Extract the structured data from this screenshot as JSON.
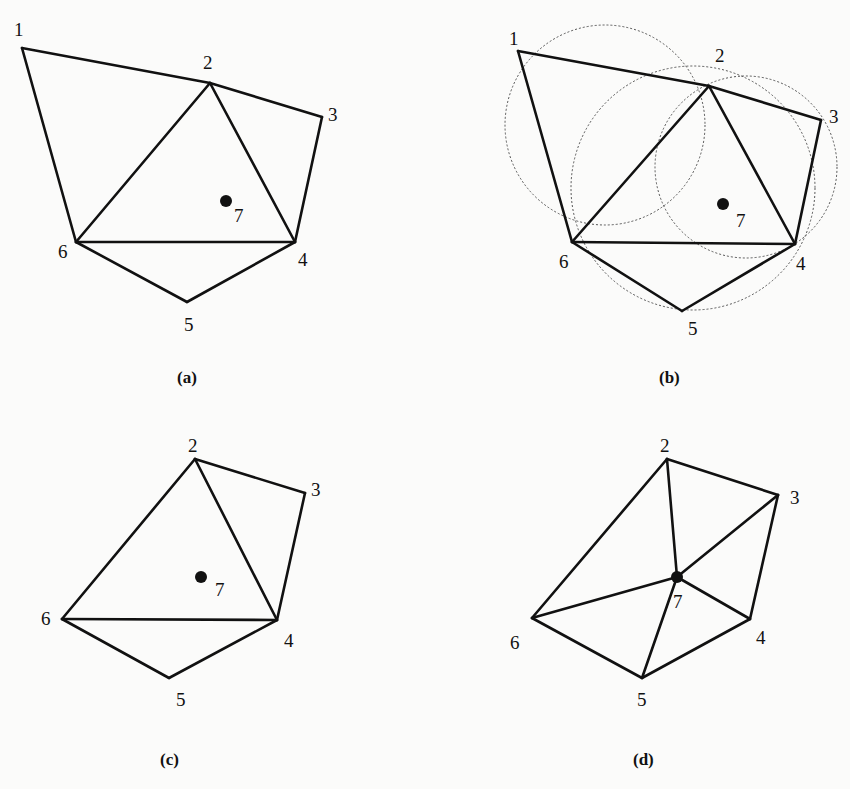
{
  "figure": {
    "panels": [
      {
        "id": "a",
        "caption": "(a)",
        "vertices": {
          "1": [
            22,
            48
          ],
          "2": [
            210,
            83
          ],
          "3": [
            322,
            117
          ],
          "4": [
            295,
            242
          ],
          "5": [
            187,
            302
          ],
          "6": [
            76,
            242
          ]
        },
        "labels": {
          "1": [
            14,
            36
          ],
          "2": [
            203,
            69
          ],
          "3": [
            328,
            121
          ],
          "4": [
            298,
            266
          ],
          "5": [
            184,
            331
          ],
          "6": [
            58,
            258
          ],
          "7": [
            234,
            222
          ]
        },
        "insert_point": {
          "id": "7",
          "pos": [
            226,
            201
          ]
        },
        "edges": [
          [
            "1",
            "2"
          ],
          [
            "2",
            "3"
          ],
          [
            "3",
            "4"
          ],
          [
            "4",
            "5"
          ],
          [
            "5",
            "6"
          ],
          [
            "6",
            "1"
          ],
          [
            "2",
            "6"
          ],
          [
            "2",
            "4"
          ],
          [
            "6",
            "4"
          ]
        ],
        "circles": [],
        "caption_pos": [
          177,
          383
        ]
      },
      {
        "id": "b",
        "caption": "(b)",
        "vertices": {
          "1": [
            518,
            51
          ],
          "2": [
            709,
            86
          ],
          "3": [
            821,
            120
          ],
          "4": [
            795,
            244
          ],
          "5": [
            682,
            311
          ],
          "6": [
            572,
            242
          ]
        },
        "labels": {
          "1": [
            509,
            45
          ],
          "2": [
            715,
            62
          ],
          "3": [
            829,
            123
          ],
          "4": [
            796,
            270
          ],
          "5": [
            688,
            335
          ],
          "6": [
            559,
            268
          ],
          "7": [
            736,
            227
          ]
        },
        "insert_point": {
          "id": "7",
          "pos": [
            723,
            204
          ]
        },
        "edges": [
          [
            "1",
            "2"
          ],
          [
            "2",
            "3"
          ],
          [
            "3",
            "4"
          ],
          [
            "4",
            "5"
          ],
          [
            "5",
            "6"
          ],
          [
            "6",
            "1"
          ],
          [
            "2",
            "6"
          ],
          [
            "2",
            "4"
          ],
          [
            "6",
            "4"
          ]
        ],
        "circles": [
          {
            "cx": 605,
            "cy": 125,
            "r": 100
          },
          {
            "cx": 693,
            "cy": 188,
            "r": 122
          },
          {
            "cx": 746,
            "cy": 167,
            "r": 91
          }
        ],
        "caption_pos": [
          659,
          383
        ]
      },
      {
        "id": "c",
        "caption": "(c)",
        "vertices": {
          "2": [
            195,
            459
          ],
          "3": [
            305,
            493
          ],
          "4": [
            277,
            620
          ],
          "5": [
            169,
            678
          ],
          "6": [
            62,
            619
          ]
        },
        "labels": {
          "2": [
            188,
            452
          ],
          "3": [
            311,
            496
          ],
          "4": [
            284,
            647
          ],
          "5": [
            176,
            706
          ],
          "6": [
            41,
            625
          ],
          "7": [
            215,
            596
          ]
        },
        "insert_point": {
          "id": "7",
          "pos": [
            201,
            577
          ]
        },
        "edges": [
          [
            "2",
            "3"
          ],
          [
            "3",
            "4"
          ],
          [
            "4",
            "5"
          ],
          [
            "5",
            "6"
          ],
          [
            "2",
            "6"
          ],
          [
            "2",
            "4"
          ],
          [
            "6",
            "4"
          ]
        ],
        "circles": [],
        "caption_pos": [
          160,
          765
        ]
      },
      {
        "id": "d",
        "caption": "(d)",
        "vertices": {
          "2": [
            667,
            459
          ],
          "3": [
            778,
            495
          ],
          "4": [
            750,
            619
          ],
          "5": [
            642,
            678
          ],
          "6": [
            532,
            618
          ],
          "7": [
            677,
            577
          ]
        },
        "labels": {
          "2": [
            660,
            452
          ],
          "3": [
            790,
            504
          ],
          "4": [
            756,
            644
          ],
          "5": [
            637,
            706
          ],
          "6": [
            510,
            649
          ],
          "7": [
            673,
            608
          ]
        },
        "insert_point": {
          "id": "7",
          "pos": [
            677,
            577
          ]
        },
        "edges": [
          [
            "2",
            "3"
          ],
          [
            "3",
            "4"
          ],
          [
            "4",
            "5"
          ],
          [
            "5",
            "6"
          ],
          [
            "6",
            "2"
          ],
          [
            "7",
            "2"
          ],
          [
            "7",
            "3"
          ],
          [
            "7",
            "4"
          ],
          [
            "7",
            "5"
          ],
          [
            "7",
            "6"
          ]
        ],
        "circles": [],
        "caption_pos": [
          633,
          765
        ]
      }
    ],
    "colors": {
      "stroke": "#111111",
      "circle": "#555555",
      "background": "#fbfbfa"
    }
  }
}
